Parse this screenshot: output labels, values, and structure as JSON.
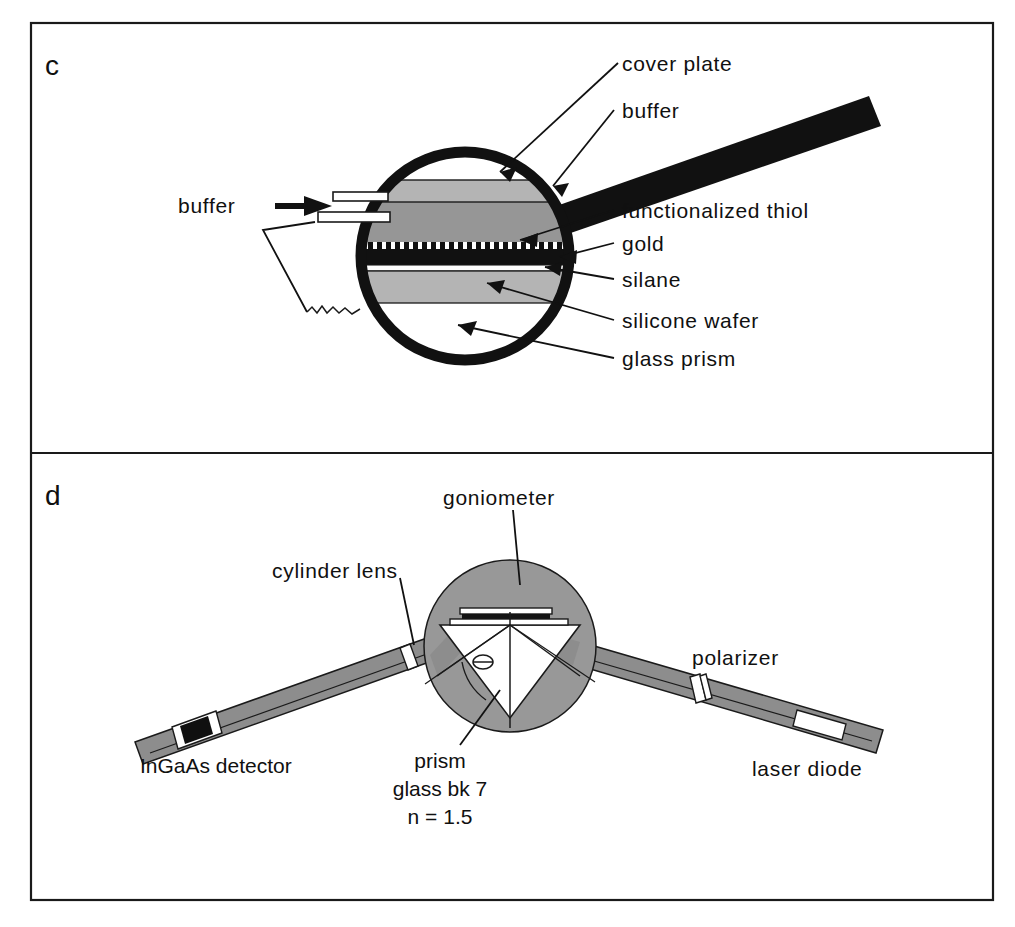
{
  "figure": {
    "background_color": "#ffffff",
    "frame_color": "#1a1a1a",
    "panels": [
      {
        "letter": "c",
        "name": "sensor-chip-cross-section",
        "labels": [
          "cover plate",
          "buffer",
          "functionalized thiol",
          "gold",
          "silane",
          "silicone wafer",
          "glass prism"
        ],
        "inlet_label": "buffer"
      },
      {
        "letter": "d",
        "name": "spr-optical-setup",
        "labels": [
          "goniometer",
          "cylinder lens",
          "polarizer",
          "InGaAs detector",
          "laser diode",
          "prism",
          "glass bk 7",
          "n = 1.5"
        ],
        "angle_symbol": "Θ"
      }
    ]
  },
  "panel_c": {
    "letter": "c",
    "label_cover_plate": "cover plate",
    "label_buffer_top": "buffer",
    "label_functionalized_thiol": "functionalized thiol",
    "label_gold": "gold",
    "label_silane": "silane",
    "label_silicone_wafer": "silicone wafer",
    "label_glass_prism": "glass prism",
    "label_buffer_inlet": "buffer",
    "colors": {
      "cover_plate": "#b4b4b4",
      "buffer_layer": "#969696",
      "gold_layer": "#111111",
      "silane_layer": "#ffffff",
      "silicone_wafer": "#b4b4b4",
      "magnifier_ring": "#111111",
      "arm": "#111111",
      "outline": "#1a1a1a"
    }
  },
  "panel_d": {
    "letter": "d",
    "label_goniometer": "goniometer",
    "label_cylinder_lens": "cylinder lens",
    "label_polarizer": "polarizer",
    "label_ingaas_detector": "InGaAs detector",
    "label_laser_diode": "laser diode",
    "label_prism_line1": "prism",
    "label_prism_line2": "glass bk 7",
    "label_prism_line3": "n = 1.5",
    "angle_symbol": "Θ",
    "colors": {
      "goniometer_disc": "#989898",
      "arm": "#8d8d8d",
      "prism_fill": "#ffffff",
      "detector_window": "#ffffff",
      "detector_chip": "#101010",
      "polarizer": "#ffffff",
      "laser_window": "#ffffff",
      "outline": "#1a1a1a"
    }
  }
}
